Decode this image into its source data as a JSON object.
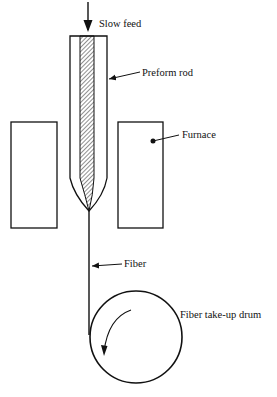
{
  "diagram": {
    "type": "fiber drawing process schematic",
    "labels": {
      "slow_feed": "Slow feed",
      "preform_rod": "Preform rod",
      "furnace": "Furnace",
      "fiber": "Fiber",
      "drum": "Fiber take-up drum"
    },
    "colors": {
      "stroke": "#111111",
      "background": "#ffffff"
    }
  }
}
